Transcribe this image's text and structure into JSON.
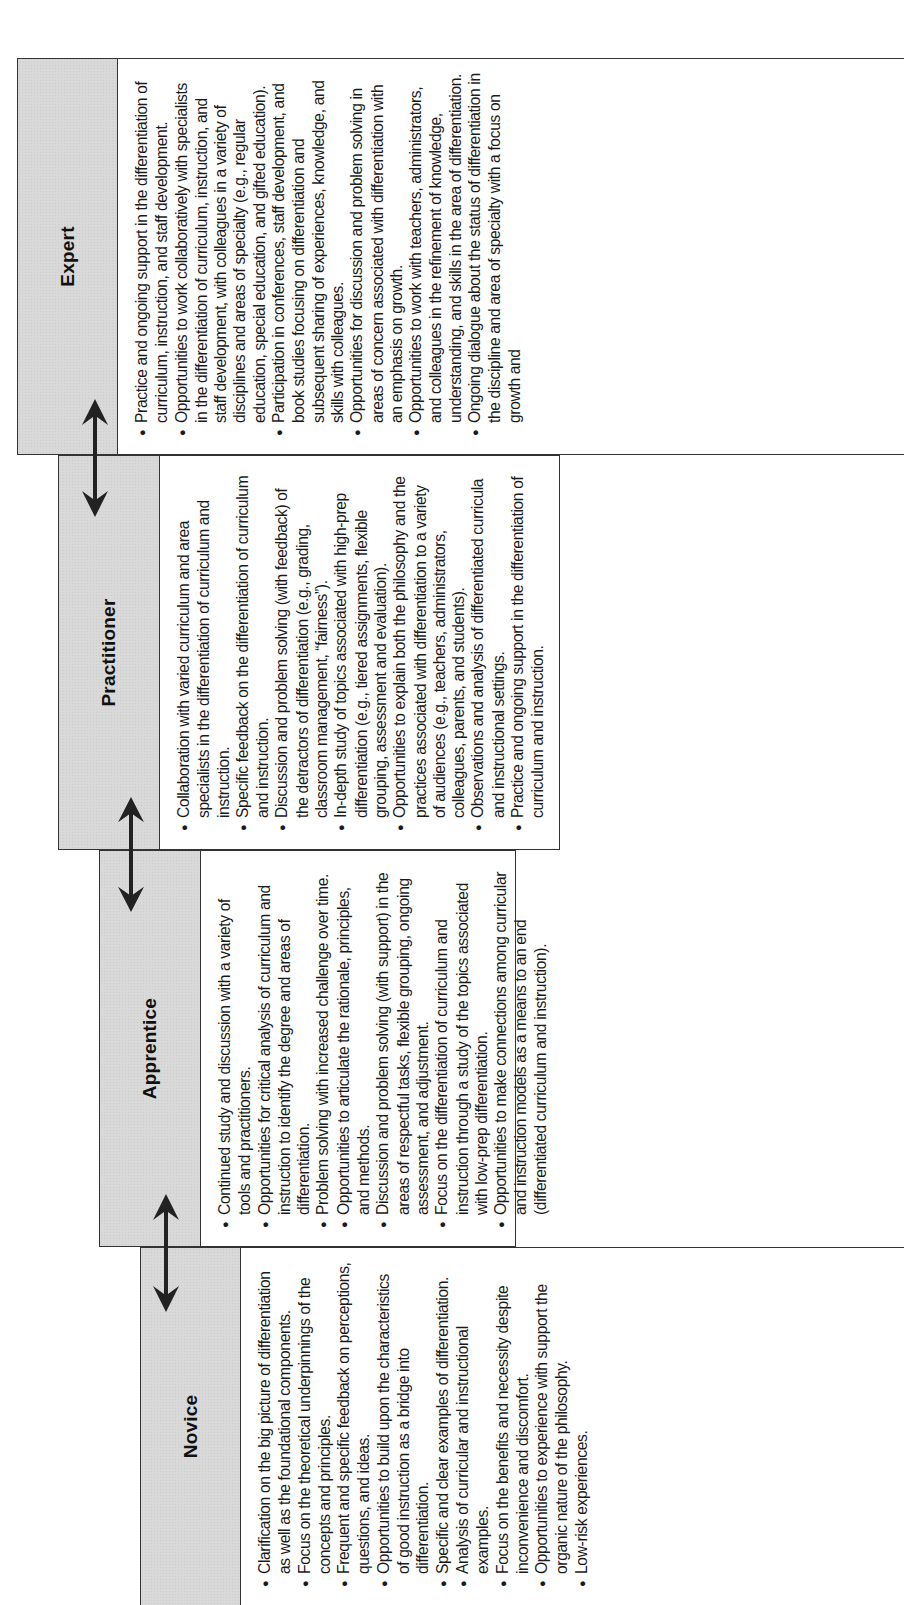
{
  "stages": [
    {
      "id": "novice",
      "title": "Novice",
      "items": [
        "Clarification on the big picture of differentiation as well as the foundational components.",
        "Focus on the theoretical underpinnings of the concepts and principles.",
        "Frequent and specific feedback on perceptions, questions, and ideas.",
        "Opportunities to build upon the characteristics of good instruction as a bridge into differentiation.",
        "Specific and clear examples of differentiation.",
        "Analysis of curricular and instructional examples.",
        "Focus on the benefits and necessity despite inconvenience and discomfort.",
        "Opportunities to experience with support the organic nature of the philosophy.",
        "Low-risk experiences."
      ]
    },
    {
      "id": "apprentice",
      "title": "Apprentice",
      "items": [
        "Continued study and discussion with a variety of tools and practitioners.",
        "Opportunities for critical analysis of curriculum and instruction to identify the degree and areas of differentiation.",
        "Problem solving with increased challenge over time.",
        "Opportunities to articulate the rationale, principles, and methods.",
        "Discussion and problem solving (with support) in the areas of respectful tasks, flexible grouping, ongoing assessment, and adjustment.",
        "Focus on the differentiation of curriculum and instruction through a study of the topics associated with low-prep differentiation.",
        "Opportunities to make connections among curricular and instruction models as a means to an end (differentiated curriculum and instruction)."
      ]
    },
    {
      "id": "practitioner",
      "title": "Practitioner",
      "items": [
        "Collaboration with varied curriculum and area specialists in the differentiation of curriculum and instruction.",
        "Specific feedback on the differentiation of curriculum and instruction.",
        "Discussion and problem solving (with feedback) of the detractors of differentiation (e.g., grading, classroom management, “fairness”).",
        "In-depth study of topics associated with high-prep differentiation (e.g., tiered assignments, flexible grouping, assessment and evaluation).",
        "Opportunities to explain both the philosophy and the practices associated with differentiation to a variety of audiences (e.g., teachers, administrators, colleagues, parents, and students).",
        "Observations and analysis of differentiated curricula and instructional settings.",
        "Practice and ongoing support in the differentiation of curriculum and instruction."
      ]
    },
    {
      "id": "expert",
      "title": "Expert",
      "items": [
        "Practice and ongoing support in the differentiation of curriculum, instruction, and staff development.",
        "Opportunities to work collaboratively with specialists in the differentiation of curriculum, instruction, and staff development, with colleagues in a variety of disciplines and areas of specialty (e.g., regular education, special education, and gifted education).",
        "Participation in conferences, staff development, and book studies focusing on differentiation and subsequent sharing of experiences, knowledge, and skills with colleagues.",
        "Opportunities for discussion and problem solving in areas of concern associated with differentiation with an emphasis on growth.",
        "Opportunities to work with teachers, administrators, and colleagues in the refinement of knowledge, understanding, and skills in the area of differentiation.",
        "Ongoing dialogue about the status of differentiation in the discipline and area of specialty with a focus on growth and"
      ]
    }
  ],
  "connectors": [
    {
      "from": "Novice",
      "to": "Apprentice",
      "icon": "double-arrow-icon"
    },
    {
      "from": "Apprentice",
      "to": "Practitioner",
      "icon": "double-arrow-icon"
    },
    {
      "from": "Practitioner",
      "to": "Expert",
      "icon": "double-arrow-icon"
    }
  ],
  "colors": {
    "header_fill": "#d9d9d9",
    "border": "#333333",
    "arrow": "#222222",
    "text": "#1a1a1a"
  }
}
